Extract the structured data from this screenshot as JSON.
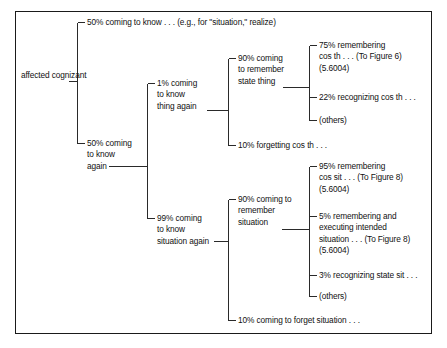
{
  "diagram": {
    "type": "tree",
    "title": "",
    "border_color": "#1a1a1a",
    "line_color": "#2a2a2a",
    "text_color": "#111111",
    "root": {
      "label": "affected\ncognizant"
    },
    "nodes": {
      "root": "affected cognizant",
      "n_50_know": "50% coming to know . . . (e.g., for \"situation,\" realize)",
      "n_50_again": "50% coming\nto know\nagain",
      "n_1_thing": "1% coming\nto know\nthing again",
      "n_99_situation": "99% coming\nto know\nsituation again",
      "n_90_state_thing": "90% coming\nto remember\nstate thing",
      "n_10_forget_cos_th": "10% forgetting cos th . . .",
      "n_90_remember_situation": "90% coming to\nremember\nsituation",
      "n_10_forget_situation": "10% coming to forget situation . . .",
      "n_75_remember": "75% remembering\ncos th . . . (To Figure 6)\n(5.6004)",
      "n_22_recognize": "22% recognizing cos th . . .",
      "n_others_thing": "(others)",
      "n_95_remember": "95% remembering\ncos sit . . . (To Figure 8)\n(5.6004)",
      "n_5_remember_exec": "5% remembering and\nexecuting intended\nsituation . . . (To Figure 8)\n(5.6004)",
      "n_3_recognize": "3% recognizing state sit . . .",
      "n_others_situation": "(others)"
    },
    "branches": [
      {
        "parent": "root",
        "child": "n_50_know",
        "share": "50%"
      },
      {
        "parent": "root",
        "child": "n_50_again",
        "share": "50%"
      },
      {
        "parent": "n_50_again",
        "child": "n_1_thing",
        "share": "1%"
      },
      {
        "parent": "n_50_again",
        "child": "n_99_situation",
        "share": "99%"
      },
      {
        "parent": "n_1_thing",
        "child": "n_90_state_thing",
        "share": "90%"
      },
      {
        "parent": "n_1_thing",
        "child": "n_10_forget_cos_th",
        "share": "10%"
      },
      {
        "parent": "n_90_state_thing",
        "child": "n_75_remember",
        "share": "75%"
      },
      {
        "parent": "n_90_state_thing",
        "child": "n_22_recognize",
        "share": "22%"
      },
      {
        "parent": "n_90_state_thing",
        "child": "n_others_thing",
        "share": "others"
      },
      {
        "parent": "n_99_situation",
        "child": "n_90_remember_situation",
        "share": "90%"
      },
      {
        "parent": "n_99_situation",
        "child": "n_10_forget_situation",
        "share": "10%"
      },
      {
        "parent": "n_90_remember_situation",
        "child": "n_95_remember",
        "share": "95%"
      },
      {
        "parent": "n_90_remember_situation",
        "child": "n_5_remember_exec",
        "share": "5%"
      },
      {
        "parent": "n_90_remember_situation",
        "child": "n_3_recognize",
        "share": "3%"
      },
      {
        "parent": "n_90_remember_situation",
        "child": "n_others_situation",
        "share": "others"
      }
    ]
  }
}
